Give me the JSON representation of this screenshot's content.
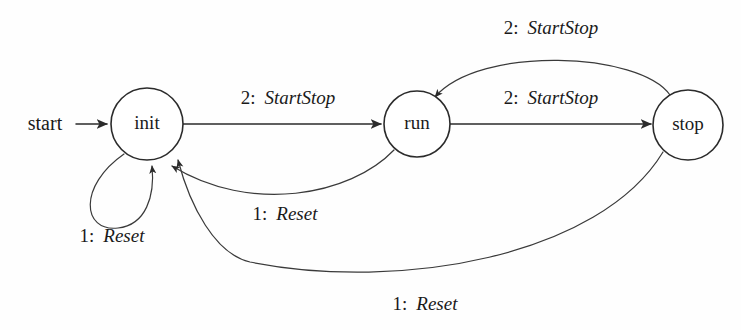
{
  "diagram": {
    "kind": "state-machine-diagram",
    "background_color": "#fefefe",
    "stroke_color": "#2b2b2b",
    "text_color": "#1a1a1a",
    "start_marker": {
      "label": "start"
    },
    "states": [
      {
        "id": "init",
        "label": "init",
        "cx": 147,
        "cy": 124,
        "r": 36
      },
      {
        "id": "run",
        "label": "run",
        "cx": 417,
        "cy": 124,
        "r": 33
      },
      {
        "id": "stop",
        "label": "stop",
        "cx": 688,
        "cy": 125,
        "r": 35
      }
    ],
    "transitions": [
      {
        "id": "init-to-run",
        "from": "init",
        "to": "run",
        "number": "2:",
        "event": "StartStop",
        "label": "2: StartStop",
        "label_x": 288,
        "label_y": 100
      },
      {
        "id": "run-to-stop",
        "from": "run",
        "to": "stop",
        "number": "2:",
        "event": "StartStop",
        "label": "2: StartStop",
        "label_x": 551,
        "label_y": 100
      },
      {
        "id": "stop-to-run",
        "from": "stop",
        "to": "run",
        "number": "2:",
        "event": "StartStop",
        "label": "2: StartStop",
        "label_x": 551,
        "label_y": 30
      },
      {
        "id": "init-self-loop",
        "from": "init",
        "to": "init",
        "number": "1:",
        "event": "Reset",
        "label": "1: Reset",
        "label_x": 112,
        "label_y": 238
      },
      {
        "id": "run-to-init",
        "from": "run",
        "to": "init",
        "number": "1:",
        "event": "Reset",
        "label": "1: Reset",
        "label_x": 285,
        "label_y": 216
      },
      {
        "id": "stop-to-init",
        "from": "stop",
        "to": "init",
        "number": "1:",
        "event": "Reset",
        "label": "1: Reset",
        "label_x": 425,
        "label_y": 306
      }
    ]
  }
}
